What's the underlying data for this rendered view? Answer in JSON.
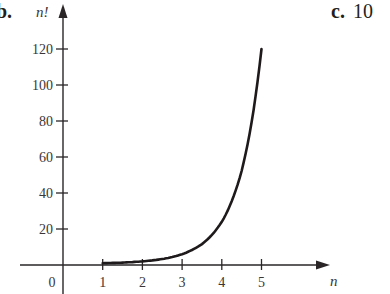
{
  "panel_b": {
    "label": "b."
  },
  "panel_c": {
    "label": "c.",
    "value": "10"
  },
  "chart_data": {
    "type": "line",
    "title": "",
    "xlabel": "n",
    "ylabel": "n!",
    "x": [
      1,
      1.5,
      2,
      2.5,
      3,
      3.5,
      4,
      4.5,
      5
    ],
    "series": [
      {
        "name": "n!",
        "values": [
          1,
          1.33,
          2,
          3.32,
          6,
          11.63,
          24,
          52.34,
          120
        ]
      }
    ],
    "xticks": [
      0,
      1,
      2,
      3,
      4,
      5
    ],
    "yticks": [
      20,
      40,
      60,
      80,
      100,
      120
    ],
    "xlim": [
      -1,
      5.8
    ],
    "ylim": [
      -12,
      138
    ],
    "grid": false,
    "legend": "none"
  }
}
